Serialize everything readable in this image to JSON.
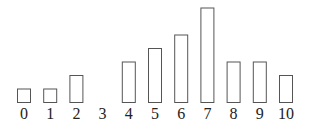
{
  "chart_data": {
    "type": "bar",
    "title": "",
    "xlabel": "",
    "ylabel": "",
    "categories": [
      "0",
      "1",
      "2",
      "3",
      "4",
      "5",
      "6",
      "7",
      "8",
      "9",
      "10"
    ],
    "values": [
      1,
      1,
      2,
      0,
      3,
      4,
      5,
      7,
      3,
      3,
      2
    ],
    "ylim": [
      0,
      7
    ],
    "grid": false,
    "legend": null,
    "style": {
      "bar_fill": "#ffffff",
      "bar_stroke": "#555555"
    }
  }
}
